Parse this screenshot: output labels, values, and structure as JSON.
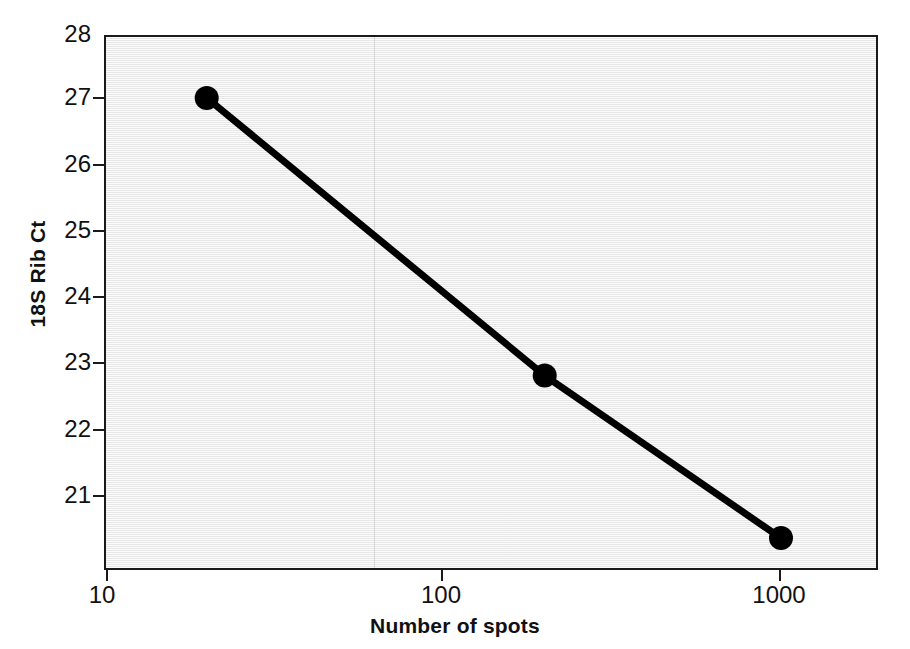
{
  "chart_data": {
    "type": "line",
    "title": "",
    "xlabel": "Number of spots",
    "ylabel": "18S Rib Ct",
    "xscale": "log",
    "yscale": "linear",
    "xlim": [
      10,
      2000
    ],
    "ylim": [
      20.1,
      28
    ],
    "grid": false,
    "legend": null,
    "xticks": [
      {
        "value": 10,
        "label": "10"
      },
      {
        "value": 100,
        "label": "100"
      },
      {
        "value": 1000,
        "label": "1000"
      }
    ],
    "yticks": [
      {
        "value": 28,
        "label": "28"
      },
      {
        "value": 27,
        "label": "27"
      },
      {
        "value": 26,
        "label": "26"
      },
      {
        "value": 25,
        "label": "25"
      },
      {
        "value": 24,
        "label": "24"
      },
      {
        "value": 23,
        "label": "23"
      },
      {
        "value": 22,
        "label": "22"
      },
      {
        "value": 21,
        "label": "21"
      }
    ],
    "series": [
      {
        "name": "18S Rib Ct vs number of spots",
        "marker": "filled-circle",
        "color": "#000000",
        "points": [
          {
            "x": 20,
            "y": 27.1
          },
          {
            "x": 200,
            "y": 23.0
          },
          {
            "x": 1000,
            "y": 20.6
          }
        ]
      }
    ],
    "colors": {
      "plot_background": "#eeeeee",
      "figure_background": "#ffffff",
      "axis": "#1a1a1a",
      "series": "#000000"
    }
  }
}
